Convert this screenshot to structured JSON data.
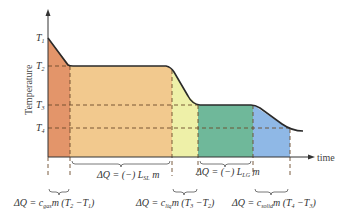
{
  "diagram": {
    "y_axis_label": "Temperature",
    "x_axis_label": "time",
    "temperature_levels": [
      {
        "id": "T1",
        "label_main": "T",
        "label_sub": "1"
      },
      {
        "id": "T2",
        "label_main": "T",
        "label_sub": "2"
      },
      {
        "id": "T3",
        "label_main": "T",
        "label_sub": "3"
      },
      {
        "id": "T4",
        "label_main": "T",
        "label_sub": "4"
      }
    ],
    "regions": [
      {
        "id": "gas",
        "name": "Gas cooling",
        "color": "#e3956a"
      },
      {
        "id": "gas-liquid",
        "name": "Condensation",
        "color": "#f2c98e"
      },
      {
        "id": "liquid",
        "name": "Liquid cooling",
        "color": "#eef0a8"
      },
      {
        "id": "liquid-solid",
        "name": "Freezing",
        "color": "#6fb89a"
      },
      {
        "id": "solid",
        "name": "Solid cooling",
        "color": "#8fb8e6"
      }
    ],
    "equations": {
      "gas": "ΔQ = c_gas m (T2 − T1)",
      "condensation": "ΔQ = (−) L_SL m",
      "liquid": "ΔQ = c_liq m (T3 − T2)",
      "freezing": "ΔQ = (−) L_LG m",
      "solid": "ΔQ = c_solid m (T4 − T3)"
    },
    "equation_parts": {
      "gas": {
        "pre": "ΔQ = c",
        "sub": "gas",
        "post": "m (T",
        "s1": "2",
        "mid": " −T",
        "s2": "1",
        "end": ")"
      },
      "condensation": {
        "pre": "ΔQ = (−) L",
        "sub": "SL",
        "post": " m"
      },
      "liquid": {
        "pre": "ΔQ = c",
        "sub": "liq",
        "post": "m (T",
        "s1": "3",
        "mid": " −T",
        "s2": "2",
        "end": ")"
      },
      "freezing": {
        "pre": "ΔQ = (−) L",
        "sub": "LG",
        "post": " m"
      },
      "solid": {
        "pre": "ΔQ = c",
        "sub": "solid",
        "post": "m (T",
        "s1": "4",
        "mid": " −T",
        "s2": "3",
        "end": ")"
      }
    },
    "colors": {
      "curve": "#2a2a2a",
      "dashed": "#6b4a2a",
      "axis": "#333333"
    }
  }
}
